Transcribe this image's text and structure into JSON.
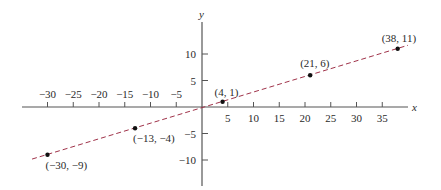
{
  "chart_data": {
    "type": "scatter",
    "title": "",
    "xlabel": "x",
    "ylabel": "y",
    "xlim": [
      -34,
      40
    ],
    "ylim": [
      -15,
      15
    ],
    "grid": false,
    "x_ticks": [
      -30,
      -25,
      -20,
      -15,
      -10,
      -5,
      5,
      10,
      15,
      20,
      25,
      30,
      35
    ],
    "x_tick_labels": [
      "−30",
      "−25",
      "−20",
      "−15",
      "−10",
      "−5",
      "5",
      "10",
      "15",
      "20",
      "25",
      "30",
      "35"
    ],
    "y_ticks": [
      10,
      5,
      -5,
      -10
    ],
    "y_tick_labels": [
      "10",
      "5",
      "−5",
      "−10"
    ],
    "series": [
      {
        "name": "points",
        "x": [
          -30,
          -13,
          4,
          21,
          38
        ],
        "y": [
          -9,
          -4,
          1,
          6,
          11
        ],
        "labels": [
          "(−30, −9)",
          "(−13, −4)",
          "(4, 1)",
          "(21, 6)",
          "(38, 11)"
        ]
      }
    ],
    "fit_line": {
      "style": "dashed",
      "color": "#a0334a",
      "x_range": [
        -33,
        40
      ],
      "description": "line through the points, y = (5/17)x - 2/17 approx"
    },
    "colors": {
      "axes": "#555555",
      "points": "#111111",
      "line": "#a0334a"
    }
  }
}
